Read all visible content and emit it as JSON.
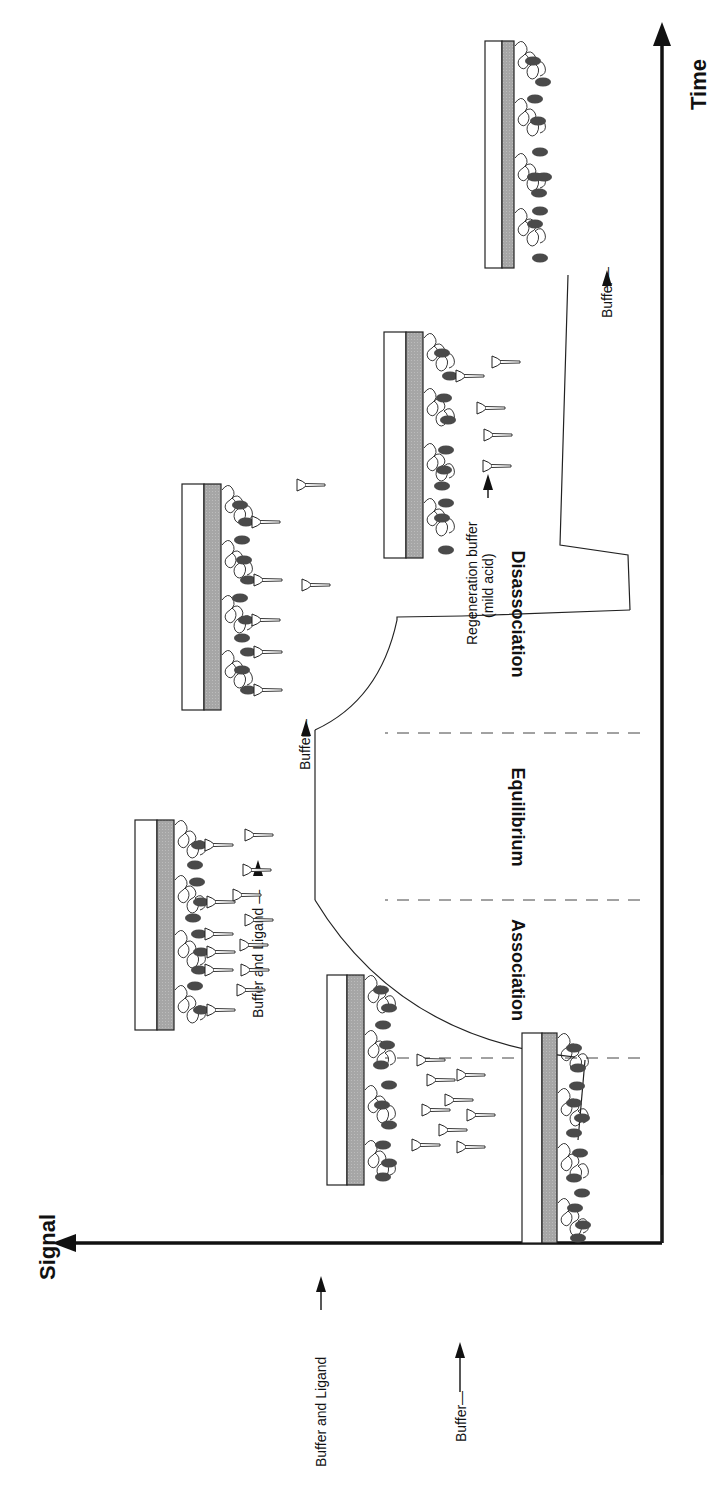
{
  "figure": {
    "orientation": "rotated 90 degrees clockwise"
  },
  "axes": {
    "y_label": "Signal",
    "x_label": "Time"
  },
  "phases": [
    {
      "id": "association",
      "label": "Association"
    },
    {
      "id": "equilibrium",
      "label": "Equilibrium"
    },
    {
      "id": "dissociation",
      "label": "Disassociation"
    }
  ],
  "injections": [
    {
      "id": "buffer-1",
      "label": "Buffer—"
    },
    {
      "id": "buffer-ligand-1",
      "label": "Buffer and Ligand"
    },
    {
      "id": "buffer-ligand-2",
      "label": "Buffer and Ligand —"
    },
    {
      "id": "buffer-2",
      "label": "Buffer—"
    },
    {
      "id": "regeneration",
      "label": "Regeneration buffer",
      "sublabel": "(mild acid)"
    },
    {
      "id": "buffer-3",
      "label": "Buffer—"
    }
  ],
  "chips": [
    {
      "id": "chip-baseline",
      "state": "receptors only"
    },
    {
      "id": "chip-injection",
      "state": "ligand flowing to surface"
    },
    {
      "id": "chip-equilibrium",
      "state": "ligand bound, ligand in solution"
    },
    {
      "id": "chip-dissociation",
      "state": "ligand partially released"
    },
    {
      "id": "chip-regeneration",
      "state": "ligand released by regeneration"
    },
    {
      "id": "chip-final",
      "state": "receptors only, regenerated"
    }
  ],
  "colors": {
    "line": "#1a1a1a",
    "gold_layer": "#a9a9a9",
    "receptor": "#4a4a4a",
    "background": "#ffffff"
  }
}
